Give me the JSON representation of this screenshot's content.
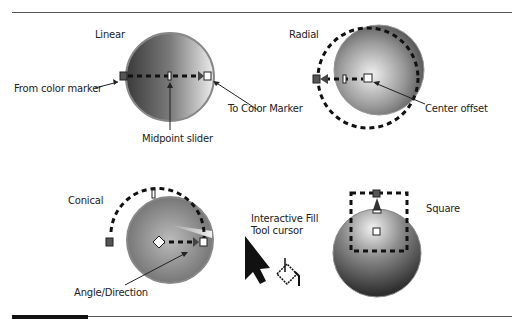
{
  "panels": {
    "linear": {
      "title": "Linear",
      "callouts": {
        "from": "From color marker",
        "to": "To Color Marker",
        "midpoint": "Midpoint slider"
      }
    },
    "radial": {
      "title": "Radial",
      "callouts": {
        "center": "Center offset"
      }
    },
    "conical": {
      "title": "Conical",
      "callouts": {
        "angle": "Angle/Direction"
      }
    },
    "square": {
      "title": "Square"
    },
    "cursor": {
      "line1": "Interactive Fill",
      "line2": "Tool cursor"
    }
  }
}
